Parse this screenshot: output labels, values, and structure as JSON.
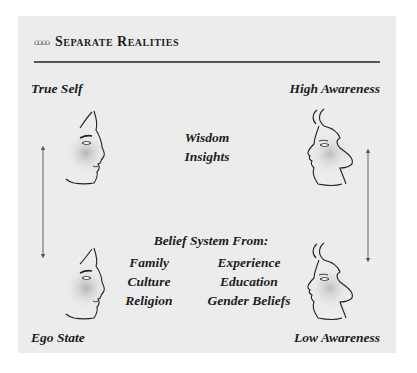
{
  "header": {
    "ornament": "ꝏꝏ",
    "title": "Separate Realities"
  },
  "left_column": {
    "top_label": "True Self",
    "bottom_label": "Ego State",
    "arrow": "double-headed-vertical"
  },
  "right_column": {
    "top_label": "High Awareness",
    "bottom_label": "Low Awareness",
    "arrow": "double-headed-vertical"
  },
  "center_top": {
    "line1": "Wisdom",
    "line2": "Insights"
  },
  "center_bottom": {
    "heading": "Belief System From:",
    "items": [
      [
        "Family",
        "Experience"
      ],
      [
        "Culture",
        "Education"
      ],
      [
        "Religion",
        "Gender Beliefs"
      ]
    ]
  },
  "colors": {
    "panel_bg": "#ececec",
    "rule": "#555555",
    "text": "#1c1c1c",
    "arrow": "#6a6a6a",
    "face_shade": "#b8b8b8"
  }
}
